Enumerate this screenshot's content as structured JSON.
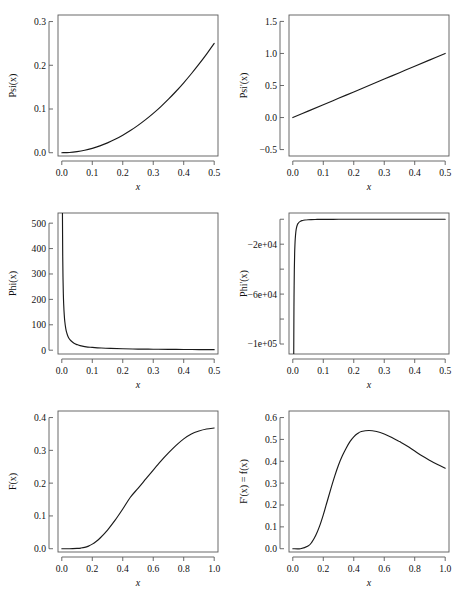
{
  "figure": {
    "background": "#ffffff",
    "curve_color": "#1a1a1a",
    "axis_color": "#5a5a5a",
    "rows": 3,
    "cols": 2
  },
  "chart_data": [
    {
      "id": "psi",
      "type": "line",
      "title": "",
      "xlabel": "x",
      "ylabel": "Psi(x)",
      "xlim": [
        -0.0125,
        0.5125
      ],
      "ylim": [
        -0.0075,
        0.315
      ],
      "xticks": [
        0.0,
        0.1,
        0.2,
        0.3,
        0.4,
        0.5
      ],
      "xticklabels": [
        "0.0",
        "0.1",
        "0.2",
        "0.3",
        "0.4",
        "0.5"
      ],
      "yticks": [
        0.0,
        0.1,
        0.2,
        0.3
      ],
      "yticklabels": [
        "0.0",
        "0.1",
        "0.2",
        "0.3"
      ],
      "grid": false,
      "x": [
        0.0,
        0.025,
        0.05,
        0.075,
        0.1,
        0.125,
        0.15,
        0.175,
        0.2,
        0.225,
        0.25,
        0.275,
        0.3,
        0.325,
        0.35,
        0.375,
        0.4,
        0.425,
        0.45,
        0.475,
        0.5
      ],
      "y": [
        0.0,
        0.0006,
        0.0025,
        0.0056,
        0.01,
        0.0156,
        0.0225,
        0.0306,
        0.04,
        0.0506,
        0.0625,
        0.0756,
        0.09,
        0.1056,
        0.1225,
        0.1406,
        0.16,
        0.1806,
        0.2025,
        0.2256,
        0.25
      ]
    },
    {
      "id": "psi-prime",
      "type": "line",
      "title": "",
      "xlabel": "x",
      "ylabel": "Psi'(x)",
      "xlim": [
        -0.0125,
        0.5125
      ],
      "ylim": [
        -0.6,
        1.6
      ],
      "xticks": [
        0.0,
        0.1,
        0.2,
        0.3,
        0.4,
        0.5
      ],
      "xticklabels": [
        "0.0",
        "0.1",
        "0.2",
        "0.3",
        "0.4",
        "0.5"
      ],
      "yticks": [
        -0.5,
        0.0,
        0.5,
        1.0,
        1.5
      ],
      "yticklabels": [
        "−0.5",
        "0.0",
        "0.5",
        "1.0",
        "1.5"
      ],
      "grid": false,
      "x": [
        0.0,
        0.05,
        0.1,
        0.15,
        0.2,
        0.25,
        0.3,
        0.35,
        0.4,
        0.45,
        0.5
      ],
      "y": [
        0.0,
        0.1,
        0.2,
        0.3,
        0.4,
        0.5,
        0.6,
        0.7,
        0.8,
        0.9,
        1.0
      ]
    },
    {
      "id": "phi",
      "type": "line",
      "title": "",
      "xlabel": "x",
      "ylabel": "Phi(x)",
      "xlim": [
        -0.0125,
        0.5125
      ],
      "ylim": [
        -15,
        540
      ],
      "xticks": [
        0.0,
        0.1,
        0.2,
        0.3,
        0.4,
        0.5
      ],
      "xticklabels": [
        "0.0",
        "0.1",
        "0.2",
        "0.3",
        "0.4",
        "0.5"
      ],
      "yticks": [
        0,
        100,
        200,
        300,
        400,
        500
      ],
      "yticklabels": [
        "0",
        "100",
        "200",
        "300",
        "400",
        "500"
      ],
      "grid": false,
      "x": [
        0.002,
        0.003,
        0.004,
        0.005,
        0.006,
        0.008,
        0.01,
        0.013,
        0.016,
        0.02,
        0.025,
        0.03,
        0.04,
        0.05,
        0.06,
        0.08,
        0.1,
        0.13,
        0.16,
        0.2,
        0.25,
        0.3,
        0.35,
        0.4,
        0.45,
        0.5
      ],
      "y": [
        555,
        370,
        278,
        222,
        185,
        139,
        111,
        85,
        69,
        55,
        44,
        37,
        27,
        22,
        18,
        13,
        11,
        8.5,
        6.9,
        5.5,
        4.4,
        3.7,
        3.1,
        2.8,
        2.4,
        2.2
      ]
    },
    {
      "id": "phi-prime",
      "type": "line",
      "title": "",
      "xlabel": "x",
      "ylabel": "Phi'(x)",
      "xlim": [
        -0.0125,
        0.5125
      ],
      "ylim": [
        -108000,
        5000
      ],
      "xticks": [
        0.0,
        0.1,
        0.2,
        0.3,
        0.4,
        0.5
      ],
      "xticklabels": [
        "0.0",
        "0.1",
        "0.2",
        "0.3",
        "0.4",
        "0.5"
      ],
      "yticks": [
        0,
        -20000,
        -40000,
        -60000,
        -80000,
        -100000
      ],
      "yticklabels": [
        "",
        "−2e+04",
        "",
        "−6e+04",
        "",
        "−1e+05"
      ],
      "grid": false,
      "x": [
        0.003,
        0.0035,
        0.004,
        0.005,
        0.006,
        0.007,
        0.008,
        0.01,
        0.012,
        0.015,
        0.018,
        0.022,
        0.026,
        0.03,
        0.035,
        0.04,
        0.05,
        0.06,
        0.08,
        0.1,
        0.15,
        0.2,
        0.25,
        0.3,
        0.35,
        0.4,
        0.45,
        0.5
      ],
      "y": [
        -111000,
        -81600,
        -62500,
        -40000,
        -27800,
        -20400,
        -15600,
        -10000,
        -6900,
        -4400,
        -3100,
        -2070,
        -1480,
        -1110,
        -816,
        -625,
        -400,
        -278,
        -156,
        -100,
        -44,
        -25,
        -16,
        -11,
        -8,
        -6,
        -5,
        -4
      ]
    },
    {
      "id": "F",
      "type": "line",
      "title": "",
      "xlabel": "x",
      "ylabel": "F(x)",
      "xlim": [
        -0.025,
        1.025
      ],
      "ylim": [
        -0.01,
        0.42
      ],
      "xticks": [
        0.0,
        0.2,
        0.4,
        0.6,
        0.8,
        1.0
      ],
      "xticklabels": [
        "0.0",
        "0.2",
        "0.4",
        "0.6",
        "0.8",
        "1.0"
      ],
      "yticks": [
        0.0,
        0.1,
        0.2,
        0.3,
        0.4
      ],
      "yticklabels": [
        "0.0",
        "0.1",
        "0.2",
        "0.3",
        "0.4"
      ],
      "grid": false,
      "x": [
        0.0,
        0.05,
        0.1,
        0.125,
        0.15,
        0.175,
        0.2,
        0.225,
        0.25,
        0.3,
        0.35,
        0.4,
        0.45,
        0.5,
        0.55,
        0.6,
        0.65,
        0.7,
        0.75,
        0.8,
        0.85,
        0.9,
        0.95,
        1.0
      ],
      "y": [
        0.0,
        0.0,
        0.001,
        0.002,
        0.004,
        0.008,
        0.014,
        0.022,
        0.032,
        0.057,
        0.087,
        0.121,
        0.157,
        0.184,
        0.212,
        0.24,
        0.267,
        0.292,
        0.315,
        0.335,
        0.35,
        0.359,
        0.365,
        0.368
      ]
    },
    {
      "id": "F-prime",
      "type": "line",
      "title": "",
      "xlabel": "x",
      "ylabel": "F'(x) = f(x)",
      "xlim": [
        -0.025,
        1.025
      ],
      "ylim": [
        -0.015,
        0.63
      ],
      "xticks": [
        0.0,
        0.2,
        0.4,
        0.6,
        0.8,
        1.0
      ],
      "xticklabels": [
        "0.0",
        "0.2",
        "0.4",
        "0.6",
        "0.8",
        "1.0"
      ],
      "yticks": [
        0.0,
        0.1,
        0.2,
        0.3,
        0.4,
        0.5,
        0.6
      ],
      "yticklabels": [
        "0.0",
        "0.1",
        "0.2",
        "0.3",
        "0.4",
        "0.5",
        "0.6"
      ],
      "grid": false,
      "x": [
        0.0,
        0.05,
        0.1,
        0.125,
        0.15,
        0.175,
        0.2,
        0.225,
        0.25,
        0.275,
        0.3,
        0.325,
        0.35,
        0.375,
        0.4,
        0.425,
        0.45,
        0.5,
        0.55,
        0.6,
        0.65,
        0.7,
        0.75,
        0.8,
        0.85,
        0.9,
        0.95,
        1.0
      ],
      "y": [
        0.0,
        0.0,
        0.012,
        0.03,
        0.06,
        0.102,
        0.155,
        0.215,
        0.275,
        0.332,
        0.383,
        0.425,
        0.46,
        0.49,
        0.512,
        0.527,
        0.536,
        0.541,
        0.536,
        0.525,
        0.509,
        0.49,
        0.47,
        0.447,
        0.424,
        0.404,
        0.385,
        0.368
      ]
    }
  ]
}
